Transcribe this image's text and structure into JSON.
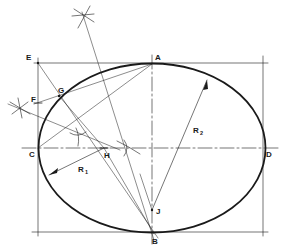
{
  "diagram": {
    "type": "geometric-construction",
    "colors": {
      "ink": "#1a1a1a",
      "background": "#ffffff"
    },
    "points": {
      "A": "A",
      "B": "B",
      "C": "C",
      "D": "D",
      "E": "E",
      "F": "F",
      "G": "G",
      "H": "H",
      "J": "J"
    },
    "radii": {
      "r1": {
        "letter": "R",
        "sub": "1"
      },
      "r2": {
        "letter": "R",
        "sub": "2"
      }
    }
  }
}
